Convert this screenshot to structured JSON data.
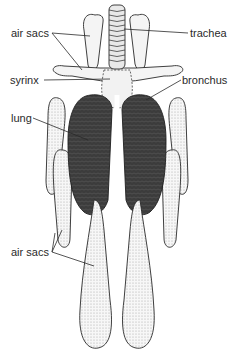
{
  "diagram": {
    "labels": [
      {
        "id": "air-sacs-upper",
        "text": "air sacs",
        "x": 11,
        "y": 27
      },
      {
        "id": "trachea",
        "text": "trachea",
        "x": 190,
        "y": 27
      },
      {
        "id": "syrinx",
        "text": "syrinx",
        "x": 10,
        "y": 74
      },
      {
        "id": "bronchus",
        "text": "bronchus",
        "x": 182,
        "y": 74
      },
      {
        "id": "lung",
        "text": "lung",
        "x": 11,
        "y": 112
      },
      {
        "id": "air-sacs-lower",
        "text": "air sacs",
        "x": 11,
        "y": 246
      }
    ],
    "colors": {
      "ink": "#2a2a2a",
      "lung_fill": "#3a3a3a",
      "sac_fill": "#f2f2f2",
      "stipple": "#9a9a9a",
      "background": "#ffffff"
    }
  }
}
